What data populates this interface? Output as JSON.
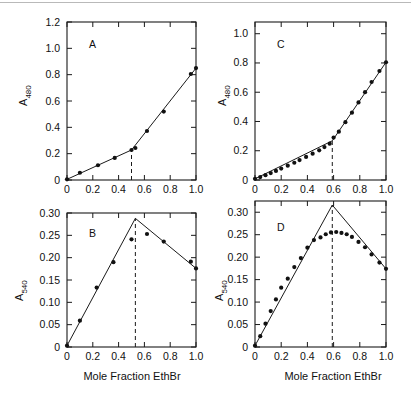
{
  "figure": {
    "background_color": "#ffffff",
    "ink_color": "#111111",
    "xlabel": "Mole  Fraction  EthBr",
    "panel_count": 4
  },
  "chart_data": [
    {
      "type": "scatter",
      "panel": "A",
      "title": "A",
      "xlabel": "Mole  Fraction  EthBr",
      "ylabel": "A480",
      "ylabel_base": "A",
      "ylabel_sub": "480",
      "xlim": [
        0,
        1.0
      ],
      "ylim": [
        0,
        1.2
      ],
      "xticks": [
        0,
        0.2,
        0.4,
        0.6,
        0.8,
        1.0
      ],
      "xticklabels": [
        "0",
        "0.2",
        "0.4",
        "0.6",
        "0.8",
        "1.0"
      ],
      "yticks": [
        0,
        0.2,
        0.4,
        0.6,
        0.8,
        1.0,
        1.2
      ],
      "yticklabels": [
        "0",
        "0.2",
        "0.4",
        "0.6",
        "0.8",
        "1.0",
        "1.2"
      ],
      "grid": false,
      "legend": "none",
      "breakpoint_x": 0.5,
      "x": [
        0.0,
        0.1,
        0.24,
        0.37,
        0.5,
        0.53,
        0.62,
        0.75,
        0.96,
        1.0
      ],
      "values": [
        0.005,
        0.055,
        0.112,
        0.168,
        0.228,
        0.243,
        0.372,
        0.52,
        0.805,
        0.85
      ],
      "fit_lines": [
        {
          "x": [
            0.0,
            0.5
          ],
          "y": [
            0.005,
            0.228
          ]
        },
        {
          "x": [
            0.5,
            1.0
          ],
          "y": [
            0.228,
            0.85
          ]
        }
      ]
    },
    {
      "type": "scatter",
      "panel": "B",
      "title": "B",
      "xlabel": "Mole  Fraction  EthBr",
      "ylabel": "A540",
      "ylabel_base": "A",
      "ylabel_sub": "540",
      "xlim": [
        0,
        1.0
      ],
      "ylim": [
        0,
        0.3
      ],
      "xticks": [
        0,
        0.2,
        0.4,
        0.6,
        0.8,
        1.0
      ],
      "xticklabels": [
        "0",
        "0.2",
        "0.4",
        "0.6",
        "0.8",
        "1.0"
      ],
      "yticks": [
        0,
        0.05,
        0.1,
        0.15,
        0.2,
        0.25,
        0.3
      ],
      "yticklabels": [
        "0",
        "0.05",
        "0.10",
        "0.15",
        "0.20",
        "0.25",
        "0.30"
      ],
      "grid": false,
      "legend": "none",
      "breakpoint_x": 0.53,
      "x": [
        0.0,
        0.1,
        0.23,
        0.36,
        0.5,
        0.62,
        0.75,
        0.96,
        1.0
      ],
      "values": [
        0.003,
        0.059,
        0.133,
        0.19,
        0.241,
        0.253,
        0.236,
        0.191,
        0.176
      ],
      "fit_lines": [
        {
          "x": [
            0.0,
            0.53
          ],
          "y": [
            0.003,
            0.288
          ]
        },
        {
          "x": [
            0.53,
            1.0
          ],
          "y": [
            0.288,
            0.176
          ]
        }
      ]
    },
    {
      "type": "scatter",
      "panel": "C",
      "title": "C",
      "xlabel": "Mole  Fraction  EthBr",
      "ylabel": "A480",
      "ylabel_base": "A",
      "ylabel_sub": "480",
      "xlim": [
        0,
        1.0
      ],
      "ylim": [
        0,
        1.08
      ],
      "xticks": [
        0,
        0.2,
        0.4,
        0.6,
        0.8,
        1.0
      ],
      "xticklabels": [
        "0",
        "0.2",
        "0.4",
        "0.6",
        "0.8",
        "1.0"
      ],
      "yticks": [
        0,
        0.2,
        0.4,
        0.6,
        0.8,
        1.0
      ],
      "yticklabels": [
        "0",
        "0.2",
        "0.4",
        "0.6",
        "0.8",
        "1.0"
      ],
      "grid": false,
      "legend": "none",
      "breakpoint_x": 0.59,
      "x": [
        0.0,
        0.04,
        0.08,
        0.12,
        0.16,
        0.2,
        0.25,
        0.3,
        0.34,
        0.39,
        0.44,
        0.49,
        0.53,
        0.57,
        0.6,
        0.64,
        0.69,
        0.74,
        0.79,
        0.84,
        0.89,
        0.95,
        1.0
      ],
      "values": [
        0.008,
        0.02,
        0.033,
        0.047,
        0.062,
        0.078,
        0.098,
        0.118,
        0.136,
        0.158,
        0.18,
        0.203,
        0.225,
        0.248,
        0.29,
        0.33,
        0.395,
        0.46,
        0.53,
        0.6,
        0.67,
        0.745,
        0.805
      ],
      "fit_lines": [
        {
          "x": [
            0.0,
            0.59
          ],
          "y": [
            0.008,
            0.268
          ]
        },
        {
          "x": [
            0.59,
            1.0
          ],
          "y": [
            0.268,
            0.805
          ]
        }
      ]
    },
    {
      "type": "scatter",
      "panel": "D",
      "title": "D",
      "xlabel": "Mole  Fraction  EthBr",
      "ylabel": "A540",
      "ylabel_base": "A",
      "ylabel_sub": "540",
      "xlim": [
        0,
        1.0
      ],
      "ylim": [
        0,
        0.325
      ],
      "xticks": [
        0,
        0.2,
        0.4,
        0.6,
        0.8,
        1.0
      ],
      "xticklabels": [
        "0",
        "0.2",
        "0.4",
        "0.6",
        "0.8",
        "1.0"
      ],
      "yticks": [
        0,
        0.05,
        0.1,
        0.15,
        0.2,
        0.25,
        0.3
      ],
      "yticklabels": [
        "0",
        "0.05",
        "0.10",
        "0.15",
        "0.20",
        "0.25",
        "0.30"
      ],
      "grid": false,
      "legend": "none",
      "breakpoint_x": 0.59,
      "x": [
        0.0,
        0.04,
        0.08,
        0.12,
        0.16,
        0.2,
        0.25,
        0.3,
        0.35,
        0.4,
        0.45,
        0.5,
        0.54,
        0.58,
        0.62,
        0.66,
        0.7,
        0.74,
        0.79,
        0.84,
        0.89,
        0.95,
        1.0
      ],
      "values": [
        0.003,
        0.024,
        0.052,
        0.08,
        0.106,
        0.132,
        0.152,
        0.178,
        0.198,
        0.221,
        0.238,
        0.244,
        0.251,
        0.255,
        0.256,
        0.254,
        0.251,
        0.245,
        0.234,
        0.222,
        0.206,
        0.188,
        0.174
      ],
      "fit_lines": [
        {
          "x": [
            0.0,
            0.59
          ],
          "y": [
            0.003,
            0.316
          ]
        },
        {
          "x": [
            0.59,
            1.0
          ],
          "y": [
            0.316,
            0.174
          ]
        }
      ]
    }
  ]
}
